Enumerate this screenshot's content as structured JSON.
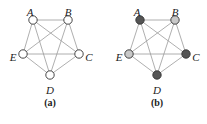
{
  "graphs": [
    {
      "id": "a",
      "caption": "(a)",
      "caption_pos": [
        50,
        104
      ],
      "nodes": [
        {
          "id": "A",
          "label": "A",
          "x": 33,
          "y": 20,
          "fill": "#ffffff",
          "lx": 30,
          "ly": 13
        },
        {
          "id": "B",
          "label": "B",
          "x": 68,
          "y": 20,
          "fill": "#ffffff",
          "lx": 68,
          "ly": 13
        },
        {
          "id": "C",
          "label": "C",
          "x": 79,
          "y": 54,
          "fill": "#ffffff",
          "lx": 89,
          "ly": 58
        },
        {
          "id": "D",
          "label": "D",
          "x": 50,
          "y": 75,
          "fill": "#ffffff",
          "lx": 50,
          "ly": 91
        },
        {
          "id": "E",
          "label": "E",
          "x": 23,
          "y": 54,
          "fill": "#ffffff",
          "lx": 13,
          "ly": 58
        }
      ]
    },
    {
      "id": "b",
      "caption": "(b)",
      "caption_pos": [
        157,
        104
      ],
      "nodes": [
        {
          "id": "A",
          "label": "A",
          "x": 140,
          "y": 20,
          "fill": "#555555",
          "lx": 137,
          "ly": 13
        },
        {
          "id": "B",
          "label": "B",
          "x": 175,
          "y": 20,
          "fill": "#c8c8c8",
          "lx": 175,
          "ly": 13
        },
        {
          "id": "C",
          "label": "C",
          "x": 186,
          "y": 54,
          "fill": "#555555",
          "lx": 196,
          "ly": 58
        },
        {
          "id": "D",
          "label": "D",
          "x": 157,
          "y": 75,
          "fill": "#555555",
          "lx": 157,
          "ly": 91
        },
        {
          "id": "E",
          "label": "E",
          "x": 129,
          "y": 54,
          "fill": "#c8c8c8",
          "lx": 119,
          "ly": 58
        }
      ]
    }
  ],
  "edges": [
    [
      "A",
      "B"
    ],
    [
      "A",
      "C"
    ],
    [
      "A",
      "D"
    ],
    [
      "A",
      "E"
    ],
    [
      "B",
      "C"
    ],
    [
      "B",
      "D"
    ],
    [
      "B",
      "E"
    ],
    [
      "C",
      "D"
    ],
    [
      "C",
      "E"
    ],
    [
      "D",
      "E"
    ]
  ],
  "style": {
    "edge_color": "#9a9a9a",
    "node_stroke": "#333333",
    "node_radius": 4.2
  }
}
